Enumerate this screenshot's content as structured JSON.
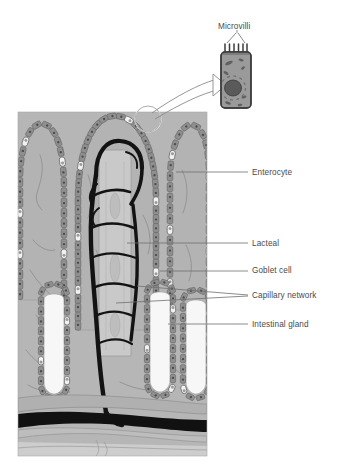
{
  "figure": {
    "background_color": "#ffffff",
    "panel_color": "#b6b6b6"
  },
  "colors": {
    "panel_bg": "#b6b6b6",
    "villus_core": "#b0b0b0",
    "epithelium": "#8f8f8f",
    "epithelium_outline": "#5d5d5d",
    "goblet_cell": "#f2f2f2",
    "nucleus": "#4a4a4a",
    "capillary": "#141414",
    "lacteal": "#c8c8c8",
    "gland_lumen": "#f5f5f5",
    "leader_line": "#6f6f6f",
    "label_text": "#4a4a4a",
    "inset_cell": "#9a9a9a",
    "inset_outline": "#3a3a3a",
    "inset_nucleus": "#545454",
    "submucosa": "#c4c4c4",
    "vessel_dark": "#111111"
  },
  "inset": {
    "label": "Microvilli",
    "microvilli_count": 6,
    "has_nucleus": true,
    "organelle_count": 7
  },
  "labels": [
    {
      "id": "enterocyte",
      "text": "Enterocyte",
      "x": 252,
      "y": 168
    },
    {
      "id": "lacteal",
      "text": "Lacteal",
      "x": 252,
      "y": 239
    },
    {
      "id": "goblet-cell",
      "text": "Goblet cell",
      "x": 252,
      "y": 266
    },
    {
      "id": "capillary-network",
      "text": "Capillary network",
      "x": 252,
      "y": 291
    },
    {
      "id": "intestinal-gland",
      "text": "Intestinal gland",
      "x": 252,
      "y": 320
    }
  ],
  "leaders": [
    {
      "id": "leader-enterocyte",
      "d": "M176,172 L248,172"
    },
    {
      "id": "leader-lacteal",
      "d": "M127,243 L248,243"
    },
    {
      "id": "leader-goblet",
      "d": "M160,271 L248,271"
    },
    {
      "id": "leader-capillary-upper",
      "d": "M137,286 L248,295"
    },
    {
      "id": "leader-capillary-lower",
      "d": "M116,303 L248,296"
    },
    {
      "id": "leader-gland",
      "d": "M168,324 L248,324"
    }
  ],
  "structures": {
    "villi": [
      {
        "id": "villus-left",
        "note": "partial villus at left edge"
      },
      {
        "id": "villus-center",
        "note": "tall central villus with lacteal and capillary network"
      },
      {
        "id": "villus-right",
        "note": "partial villus at right edge"
      }
    ],
    "glands": [
      {
        "id": "gland-1"
      },
      {
        "id": "gland-2"
      },
      {
        "id": "gland-3"
      }
    ]
  }
}
